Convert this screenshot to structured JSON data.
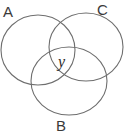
{
  "diagram": {
    "type": "venn",
    "sets": [
      {
        "label": "A",
        "cx": 38,
        "cy": 50,
        "rx": 37,
        "ry": 35
      },
      {
        "label": "C",
        "cx": 86,
        "cy": 47,
        "rx": 37,
        "ry": 34
      },
      {
        "label": "B",
        "cx": 69,
        "cy": 81,
        "rx": 38,
        "ry": 34
      }
    ],
    "center_label": "y",
    "stroke_color": "#6e6e6e"
  }
}
